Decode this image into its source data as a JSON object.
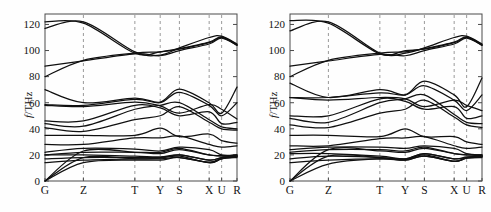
{
  "figure": {
    "kind": "phonon-dispersion",
    "panel_count": 2,
    "line_color": "#101010",
    "grid_color": "#9a9a9a",
    "axis_color": "#4a4a4a",
    "background": "#fefefe"
  },
  "axes": {
    "ylabel_prefix": "f",
    "ylabel_suffix": "/THz",
    "ylabel_full": "f/THz",
    "yticks": [
      "0",
      "20",
      "40",
      "60",
      "80",
      "100",
      "120"
    ],
    "ytick_values": [
      0,
      20,
      40,
      60,
      80,
      100,
      120
    ],
    "ylim": [
      0,
      128
    ],
    "xticks": [
      "G",
      "Z",
      "T",
      "Y",
      "S",
      "X",
      "U",
      "R"
    ],
    "xtick_positions": [
      0,
      0.2,
      0.468,
      0.6,
      0.7,
      0.855,
      0.92,
      1.0
    ],
    "gridlines_at": [
      "Z",
      "T",
      "Y",
      "S",
      "X",
      "U"
    ],
    "grid": "vertical-dashed"
  },
  "chart_data": {
    "type": "line",
    "title": "",
    "xlabel": "",
    "ylabel": "f/THz",
    "ylim": [
      0,
      128
    ],
    "xlim": [
      0,
      1
    ],
    "grid": "vertical dashed at high-symmetry points",
    "legend": "none",
    "x": [
      0,
      0.2,
      0.468,
      0.6,
      0.7,
      0.855,
      0.92,
      1.0
    ],
    "x_labels": [
      "G",
      "Z",
      "T",
      "Y",
      "S",
      "X",
      "U",
      "R"
    ],
    "panels": [
      {
        "name": "left-panel",
        "series": [
          {
            "name": "band-1",
            "values": [
              117,
              122,
              99,
              96.5,
              102,
              110,
              111,
              105
            ]
          },
          {
            "name": "band-2",
            "values": [
              122,
              121,
              98,
              99,
              101,
              106,
              110,
              104
            ]
          },
          {
            "name": "band-3",
            "values": [
              80,
              92.5,
              98,
              99,
              101.5,
              106.5,
              110.5,
              104.5
            ]
          },
          {
            "name": "band-4",
            "values": [
              88,
              92,
              97.5,
              96,
              100,
              105,
              109.5,
              104
            ]
          },
          {
            "name": "band-5",
            "values": [
              70,
              60,
              63.5,
              60.5,
              70.5,
              60,
              52,
              72
            ]
          },
          {
            "name": "band-6",
            "values": [
              58.5,
              58,
              62.5,
              60,
              68,
              58,
              50,
              60
            ]
          },
          {
            "name": "band-7",
            "values": [
              58,
              57,
              60.5,
              57.5,
              52,
              58.5,
              55,
              47.5
            ]
          },
          {
            "name": "band-8",
            "values": [
              46,
              46,
              58,
              56,
              50,
              53,
              44,
              45
            ]
          },
          {
            "name": "band-9",
            "values": [
              44,
              42,
              55,
              58,
              60,
              47,
              41.5,
              40
            ]
          },
          {
            "name": "band-10",
            "values": [
              41,
              38,
              47,
              50,
              57,
              45,
              40,
              39
            ]
          },
          {
            "name": "band-11",
            "values": [
              35,
              35,
              35,
              40.5,
              34,
              36,
              31,
              29
            ]
          },
          {
            "name": "band-12",
            "values": [
              28,
              28,
              33,
              33,
              34.5,
              28,
              26,
              27
            ]
          },
          {
            "name": "band-13",
            "values": [
              22,
              25,
              24.5,
              23,
              26,
              24,
              20,
              20
            ]
          },
          {
            "name": "band-14",
            "values": [
              20,
              22,
              22,
              22,
              25,
              20,
              19.5,
              19.5
            ]
          },
          {
            "name": "band-15",
            "values": [
              20,
              20,
              19,
              18.5,
              20,
              16,
              18,
              19
            ]
          },
          {
            "name": "band-16",
            "values": [
              17,
              18,
              18,
              18,
              19,
              14,
              17,
              18.5
            ]
          },
          {
            "name": "band-17",
            "values": [
              14,
              16,
              17,
              17,
              18,
              14.5,
              17.5,
              19
            ]
          },
          {
            "name": "acoustic-1",
            "values": [
              0,
              23,
              22,
              21,
              24,
              20,
              19,
              20
            ]
          },
          {
            "name": "acoustic-2",
            "values": [
              0,
              18,
              17,
              17.5,
              20,
              16,
              18,
              19
            ]
          },
          {
            "name": "acoustic-3",
            "values": [
              0,
              14,
              16,
              16,
              18,
              14,
              17,
              18
            ]
          }
        ]
      },
      {
        "name": "right-panel",
        "series": [
          {
            "name": "band-1",
            "values": [
              115,
              122,
              98,
              98,
              102,
              110,
              111,
              105
            ]
          },
          {
            "name": "band-2",
            "values": [
              123,
              121,
              97.5,
              100,
              101,
              106,
              110,
              104
            ]
          },
          {
            "name": "band-3",
            "values": [
              80,
              92.5,
              98,
              99,
              101.5,
              106.5,
              110.5,
              104.5
            ]
          },
          {
            "name": "band-4",
            "values": [
              88,
              92,
              97,
              96,
              100,
              105,
              109.5,
              104
            ]
          },
          {
            "name": "band-5",
            "values": [
              75,
              64,
              70,
              66,
              76.5,
              66,
              57,
              79
            ]
          },
          {
            "name": "band-6",
            "values": [
              64,
              64,
              67.5,
              66,
              73,
              62,
              54,
              66
            ]
          },
          {
            "name": "band-7",
            "values": [
              64,
              62,
              64,
              63,
              57,
              62,
              58,
              54
            ]
          },
          {
            "name": "band-8",
            "values": [
              50,
              50,
              63,
              61,
              55,
              57,
              48,
              50
            ]
          },
          {
            "name": "band-9",
            "values": [
              48,
              45,
              60,
              63,
              66,
              51,
              45,
              44
            ]
          },
          {
            "name": "band-10",
            "values": [
              43,
              41,
              52,
              55,
              62,
              49,
              43,
              41
            ]
          },
          {
            "name": "band-11",
            "values": [
              35,
              35,
              34,
              40,
              34,
              34,
              30,
              28
            ]
          },
          {
            "name": "band-12",
            "values": [
              27,
              27,
              32.5,
              33,
              34,
              27,
              25,
              26
            ]
          },
          {
            "name": "band-13",
            "values": [
              24,
              26,
              26,
              25,
              27,
              25,
              21,
              20
            ]
          },
          {
            "name": "band-14",
            "values": [
              22,
              24,
              24,
              23,
              26,
              21,
              20,
              19.5
            ]
          },
          {
            "name": "band-15",
            "values": [
              21,
              21,
              19,
              17,
              21,
              17,
              18.5,
              19
            ]
          },
          {
            "name": "band-16",
            "values": [
              17,
              19,
              18,
              16.5,
              20,
              15,
              17.5,
              18.5
            ]
          },
          {
            "name": "band-17",
            "values": [
              14,
              16,
              17,
              16,
              19,
              15,
              18,
              19
            ]
          },
          {
            "name": "acoustic-1",
            "values": [
              0,
              24,
              23,
              22,
              25,
              21,
              20,
              20
            ]
          },
          {
            "name": "acoustic-2",
            "values": [
              0,
              19,
              18,
              17,
              21,
              17,
              18,
              19
            ]
          },
          {
            "name": "acoustic-3",
            "values": [
              0,
              13,
              17,
              16,
              19,
              15,
              17.5,
              18
            ]
          }
        ]
      }
    ]
  }
}
